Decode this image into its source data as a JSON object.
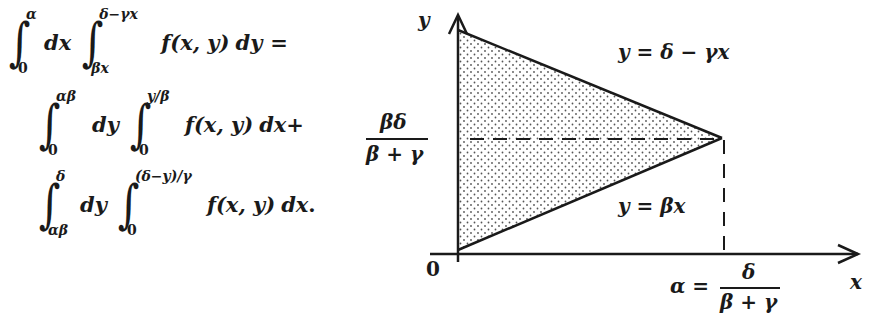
{
  "equation": {
    "line1": {
      "int1_lower": "0",
      "int1_upper": "α",
      "d1": "dx",
      "int2_lower": "βx",
      "int2_upper": "δ−γx",
      "integrand": "f(x, y)",
      "d2": "dy",
      "tail": "="
    },
    "line2": {
      "int1_lower": "0",
      "int1_upper": "αβ",
      "d1": "dy",
      "int2_lower": "0",
      "int2_upper": "y/β",
      "integrand": "f(x, y)",
      "d2": "dx",
      "tail": "+"
    },
    "line3": {
      "int1_lower": "αβ",
      "int1_upper": "δ",
      "d1": "dy",
      "int2_lower": "0",
      "int2_upper": "(δ−y)/γ",
      "integrand": "f(x, y)",
      "d2": "dx",
      "tail": "."
    },
    "integral_sign": "∫"
  },
  "diagram": {
    "y_axis_label": "y",
    "x_axis_label": "x",
    "origin_label": "0",
    "upper_line_label": "y = δ − γx",
    "lower_line_label": "y = βx",
    "y_mark": {
      "numerator": "βδ",
      "denominator": "β + γ"
    },
    "x_mark": {
      "prefix": "α =",
      "numerator": "δ",
      "denominator": "β + γ"
    },
    "colors": {
      "ink": "#1a1a1a",
      "stipple": "#555555",
      "background": "#ffffff"
    }
  }
}
